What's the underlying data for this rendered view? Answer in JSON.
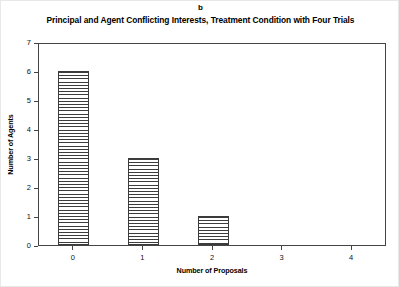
{
  "panel": {
    "label": "b"
  },
  "chart_data": {
    "type": "bar",
    "title": "Principal and Agent Conflicting Interests, Treatment Condition with Four Trials",
    "xlabel": "Number of Proposals",
    "ylabel": "Number of Agents",
    "categories": [
      "0",
      "1",
      "2",
      "3",
      "4"
    ],
    "values": [
      6,
      3,
      1,
      0,
      0
    ],
    "ylim": [
      0,
      7
    ],
    "yticks": [
      "0",
      "1",
      "2",
      "3",
      "4",
      "5",
      "6",
      "7"
    ],
    "grid": false,
    "legend": false,
    "bar_fill": "horizontal-hatch",
    "bar_edge_color": "#3a3a3a",
    "frame_color": "#444444",
    "background": "#ffffff"
  }
}
